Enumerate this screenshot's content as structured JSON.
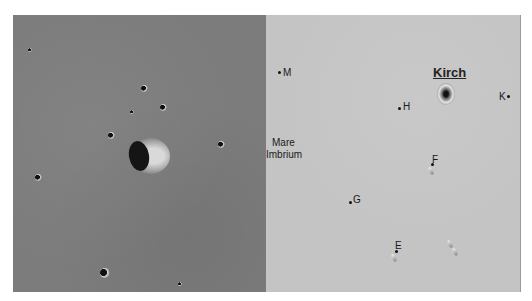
{
  "figure": {
    "left_panel": {
      "description": "Lunar surface photograph with a prominent crater"
    },
    "right_panel": {
      "region_label": [
        "Mare",
        "Imbrium"
      ],
      "named_crater": "Kirch",
      "satellite_labels": [
        {
          "letter": "M",
          "x": 14,
          "y": 56
        },
        {
          "letter": "H",
          "x": 136,
          "y": 88
        },
        {
          "letter": "K",
          "x": 233,
          "y": 76
        },
        {
          "letter": "F",
          "x": 164,
          "y": 140
        },
        {
          "letter": "G",
          "x": 85,
          "y": 180
        },
        {
          "letter": "E",
          "x": 129,
          "y": 226
        }
      ]
    }
  }
}
